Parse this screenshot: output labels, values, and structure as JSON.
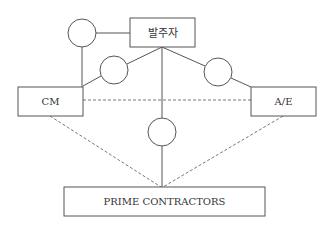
{
  "diagram": {
    "type": "organization-relationship",
    "nodes": {
      "owner": {
        "label": "발주자"
      },
      "cm": {
        "label": "CM"
      },
      "ae": {
        "label": "A/E"
      },
      "prime": {
        "label": "PRIME CONTRACTORS"
      }
    },
    "contract_circles": [
      {
        "id": "owner-cm-contract",
        "between": [
          "owner",
          "cm"
        ]
      },
      {
        "id": "owner-cm-link",
        "between": [
          "owner",
          "cm"
        ]
      },
      {
        "id": "owner-ae-link",
        "between": [
          "owner",
          "ae"
        ]
      },
      {
        "id": "owner-prime-link",
        "between": [
          "owner",
          "prime"
        ]
      }
    ],
    "edges": [
      {
        "from": "owner",
        "to": "cm",
        "style": "solid",
        "via": "owner-cm-contract"
      },
      {
        "from": "owner",
        "to": "cm",
        "style": "solid",
        "via": "owner-cm-link"
      },
      {
        "from": "owner",
        "to": "ae",
        "style": "solid",
        "via": "owner-ae-link"
      },
      {
        "from": "owner",
        "to": "prime",
        "style": "solid",
        "via": "owner-prime-link"
      },
      {
        "from": "cm",
        "to": "ae",
        "style": "dashed"
      },
      {
        "from": "cm",
        "to": "prime",
        "style": "dashed"
      },
      {
        "from": "ae",
        "to": "prime",
        "style": "dashed"
      }
    ]
  }
}
